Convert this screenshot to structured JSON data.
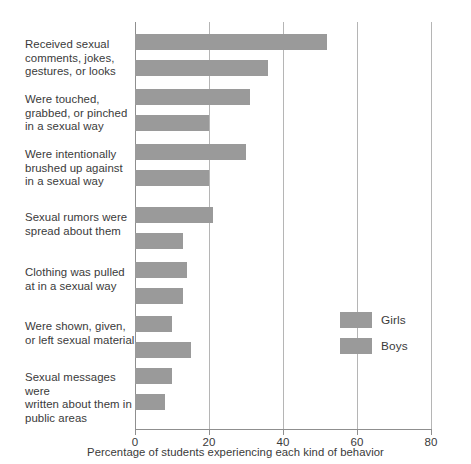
{
  "chart_data": {
    "type": "bar",
    "orientation": "horizontal",
    "title": "",
    "xlabel": "Percentage of students experiencing each kind of behavior",
    "ylabel": "",
    "xlim": [
      0,
      80
    ],
    "xticks": [
      0,
      20,
      40,
      60,
      80
    ],
    "xtick_labels": [
      "0",
      "20",
      "40",
      "60",
      "80"
    ],
    "grid": true,
    "grid_axis": "x",
    "legend_position": "inside-right",
    "bar_color": "#9a9a9a",
    "categories": [
      "Received sexual comments, jokes, gestures, or looks",
      "Were touched, grabbed, or pinched in a sexual way",
      "Were intentionally brushed up against in a sexual way",
      "Sexual rumors were spread about them",
      "Clothing was pulled at in a sexual way",
      "Were shown, given, or left sexual material",
      "Sexual messages were written about them in public areas"
    ],
    "series": [
      {
        "name": "Girls",
        "values": [
          52,
          31,
          30,
          21,
          14,
          10,
          10
        ]
      },
      {
        "name": "Boys",
        "values": [
          36,
          20,
          20,
          13,
          13,
          15,
          8
        ]
      }
    ]
  },
  "axis": {
    "x_title": "Percentage of students experiencing each kind of behavior",
    "tick_0": "0",
    "tick_20": "20",
    "tick_40": "40",
    "tick_60": "60",
    "tick_80": "80"
  },
  "categories": [
    {
      "line1": "Received sexual",
      "line2": "comments, jokes,",
      "line3": "gestures, or looks"
    },
    {
      "line1": "Were touched,",
      "line2": "grabbed, or pinched",
      "line3": "in a sexual way"
    },
    {
      "line1": "Were intentionally",
      "line2": "brushed up against",
      "line3": "in a sexual way"
    },
    {
      "line1": "Sexual rumors were",
      "line2": "spread about them",
      "line3": ""
    },
    {
      "line1": "Clothing was pulled",
      "line2": "at in a sexual way",
      "line3": ""
    },
    {
      "line1": "Were shown, given,",
      "line2": "or left sexual material",
      "line3": ""
    },
    {
      "line1": "Sexual messages were",
      "line2": "written about them in",
      "line3": "public areas"
    }
  ],
  "legend": {
    "girls_label": "Girls",
    "boys_label": "Boys"
  }
}
